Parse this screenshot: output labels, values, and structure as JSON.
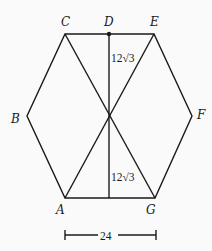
{
  "diagram": {
    "type": "geometry",
    "shape": "hexagon",
    "vertices": {
      "A": {
        "label": "A",
        "x": 65,
        "y": 198
      },
      "B": {
        "label": "B",
        "x": 27,
        "y": 116
      },
      "C": {
        "label": "C",
        "x": 65,
        "y": 34
      },
      "D": {
        "label": "D",
        "x": 109,
        "y": 34
      },
      "E": {
        "label": "E",
        "x": 154,
        "y": 34
      },
      "F": {
        "label": "F",
        "x": 192,
        "y": 116
      },
      "G": {
        "label": "G",
        "x": 155,
        "y": 198
      }
    },
    "center": {
      "x": 109,
      "y": 116
    },
    "segments": [
      [
        "A",
        "B"
      ],
      [
        "B",
        "C"
      ],
      [
        "C",
        "E"
      ],
      [
        "E",
        "F"
      ],
      [
        "F",
        "G"
      ],
      [
        "G",
        "A"
      ],
      [
        "C",
        "G"
      ],
      [
        "E",
        "A"
      ],
      [
        "D",
        "Center"
      ],
      [
        "Center",
        "AG-mid"
      ]
    ],
    "measurements": {
      "upper_height": "12√3",
      "lower_height": "12√3",
      "base_width": "24"
    },
    "colors": {
      "stroke": "#1a1a1a",
      "background": "#fafafa"
    }
  }
}
